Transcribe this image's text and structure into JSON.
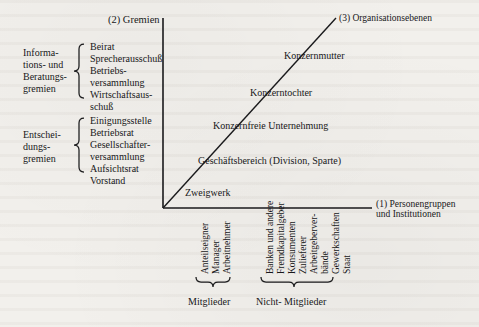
{
  "figure": {
    "axes": {
      "vertical_axis_label": "(2) Gremien",
      "horizontal_axis_label_line1": "(1) Personengruppen",
      "horizontal_axis_label_line2": "und Institutionen",
      "diagonal_axis_label": "(3) Organisationsebenen"
    },
    "diagonal_levels": [
      {
        "name": "level-konzernmutter",
        "label": "Konzernmutter"
      },
      {
        "name": "level-konzerntochter",
        "label": "Konzerntochter"
      },
      {
        "name": "level-konzernfreie-unternehmung",
        "label": "Konzernfreie Unternehmung"
      },
      {
        "name": "level-geschaeftsbereich",
        "label": "Geschäftsbereich (Division, Sparte)"
      },
      {
        "name": "level-zweigwerk",
        "label": "Zweigwerk"
      }
    ],
    "gremien_groups": [
      {
        "name": "informations-und-beratungsgremien",
        "group_label_lines": [
          "Informations-",
          "tions- und",
          "Beratungs-",
          "gremien"
        ],
        "group_label_l1": "Informa-",
        "group_label_l2": "tions- und",
        "group_label_l3": "Beratungs-",
        "group_label_l4": "gremien",
        "items": [
          "Beirat",
          "Sprecherausschuß",
          "Betriebs-",
          "versammlung",
          "Wirtschaftsaus-",
          "schuß"
        ]
      },
      {
        "name": "entscheidungsgremien",
        "group_label_l1": "Entschei-",
        "group_label_l2": "dungs-",
        "group_label_l3": "gremien",
        "items": [
          "Einigungsstelle",
          "Betriebsrat",
          "Gesellschafter-",
          "versammlung",
          "Aufsichtsrat",
          "Vorstand"
        ]
      }
    ],
    "personengruppen": {
      "mitglieder": {
        "bracket_label": "Mitglieder",
        "items": [
          {
            "l1": "Anteilseigner",
            "l2": ""
          },
          {
            "l1": "Manager",
            "l2": ""
          },
          {
            "l1": "Arbeitnehmer",
            "l2": ""
          }
        ]
      },
      "nicht_mitglieder": {
        "bracket_label": "Nicht- Mitglieder",
        "items": [
          {
            "l1": "Banken und andere",
            "l2": "Fremdkapitalgeber"
          },
          {
            "l1": "Konsumenten",
            "l2": ""
          },
          {
            "l1": "Zulieferer",
            "l2": ""
          },
          {
            "l1": "Arbeitgeberver-",
            "l2": "bände"
          },
          {
            "l1": "Gewerkschaften",
            "l2": ""
          },
          {
            "l1": "Staat",
            "l2": ""
          }
        ]
      }
    },
    "colors": {
      "paper": "#f2f0ec",
      "ink": "#18181a",
      "rule": "#1a1a1c"
    }
  }
}
